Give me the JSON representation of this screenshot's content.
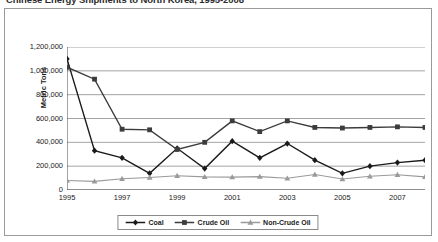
{
  "figure": {
    "title": "Chinese Energy Shipments to North Korea, 1995-2008"
  },
  "chart_data": {
    "type": "line",
    "title": "Chinese Energy Shipments to North Korea, 1995-2008",
    "xlabel": "",
    "ylabel": "Metric Tons",
    "ylim": [
      0,
      1200000
    ],
    "xlim": [
      1995,
      2008
    ],
    "grid": true,
    "legend_position": "bottom",
    "y_ticks": [
      0,
      200000,
      400000,
      600000,
      800000,
      1000000,
      1200000
    ],
    "y_tick_labels": [
      "0",
      "200,000",
      "400,000",
      "600,000",
      "800,000",
      "1,000,000",
      "1,200,000"
    ],
    "x": [
      1995,
      1996,
      1997,
      1998,
      1999,
      2000,
      2001,
      2002,
      2003,
      2004,
      2005,
      2006,
      2007,
      2008
    ],
    "x_ticks_labeled": [
      1995,
      1997,
      1999,
      2001,
      2003,
      2005,
      2007
    ],
    "x_tick_labels": [
      "1995",
      "1997",
      "1999",
      "2001",
      "2003",
      "2005",
      "2007"
    ],
    "series": [
      {
        "name": "Coal",
        "marker": "diamond",
        "color": "#1a1a1a",
        "values": [
          1100000,
          330000,
          270000,
          140000,
          350000,
          180000,
          410000,
          270000,
          390000,
          250000,
          140000,
          200000,
          230000,
          250000
        ]
      },
      {
        "name": "Crude Oil",
        "marker": "square",
        "color": "#3c3c3c",
        "values": [
          1030000,
          930000,
          510000,
          505000,
          340000,
          400000,
          580000,
          490000,
          580000,
          525000,
          520000,
          525000,
          530000,
          525000
        ]
      },
      {
        "name": "Non-Crude Oil",
        "marker": "triangle",
        "color": "#9a9a9a",
        "values": [
          80000,
          72000,
          95000,
          105000,
          120000,
          110000,
          108000,
          112000,
          98000,
          130000,
          92000,
          115000,
          128000,
          110000
        ]
      }
    ]
  }
}
